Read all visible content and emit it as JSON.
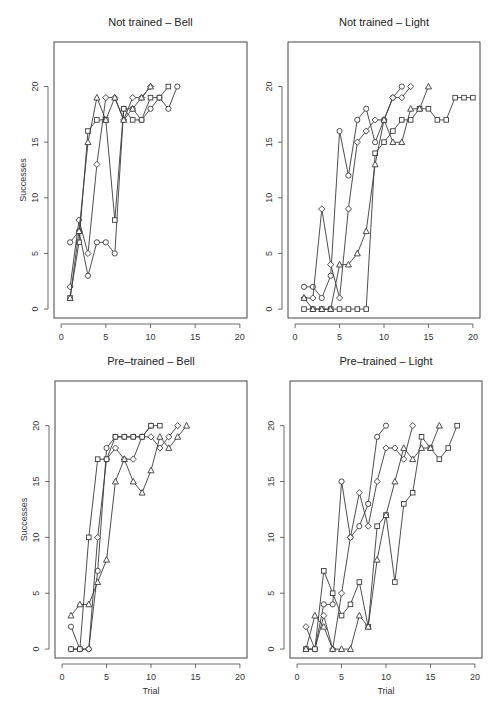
{
  "figure": {
    "ylabel": "Successes",
    "xlabel": "Trial"
  },
  "chart_data": [
    {
      "type": "line",
      "title": "Not trained – Bell",
      "xlabel": "",
      "ylabel": "Successes",
      "xlim": [
        0,
        20
      ],
      "ylim": [
        0,
        25
      ],
      "xticks": [
        0,
        5,
        10,
        15,
        20
      ],
      "yticks": [
        0,
        5,
        10,
        15,
        20
      ],
      "grid": false,
      "series": [
        {
          "name": "subject-1",
          "marker": "circle",
          "x": [
            1,
            2,
            3,
            4,
            5,
            6,
            7,
            8,
            9,
            10,
            11,
            12,
            13
          ],
          "y": [
            6,
            7,
            3,
            6,
            6,
            5,
            18,
            18,
            17,
            18,
            19,
            18,
            20
          ]
        },
        {
          "name": "subject-2",
          "marker": "diamond",
          "x": [
            1,
            2,
            3,
            4,
            5,
            6,
            7,
            8,
            9,
            10
          ],
          "y": [
            2,
            8,
            5,
            13,
            19,
            19,
            17,
            19,
            19,
            20
          ]
        },
        {
          "name": "subject-3",
          "marker": "square",
          "x": [
            1,
            2,
            3,
            4,
            5,
            6,
            7,
            8,
            9,
            10,
            11,
            12
          ],
          "y": [
            1,
            6,
            16,
            17,
            17,
            8,
            18,
            17,
            17,
            19,
            19,
            20
          ]
        },
        {
          "name": "subject-4",
          "marker": "triangle",
          "x": [
            1,
            2,
            3,
            4,
            5,
            6,
            7,
            8,
            9,
            10
          ],
          "y": [
            1,
            7,
            15,
            19,
            17,
            19,
            17,
            18,
            19,
            20
          ]
        }
      ]
    },
    {
      "type": "line",
      "title": "Not trained – Light",
      "xlabel": "",
      "ylabel": "",
      "xlim": [
        0,
        20
      ],
      "ylim": [
        0,
        25
      ],
      "xticks": [
        0,
        5,
        10,
        15,
        20
      ],
      "yticks": [
        0,
        5,
        10,
        15,
        20
      ],
      "grid": false,
      "series": [
        {
          "name": "subject-1",
          "marker": "circle",
          "x": [
            1,
            2,
            3,
            4,
            5,
            6,
            7,
            8,
            9,
            10,
            11,
            12
          ],
          "y": [
            2,
            2,
            1,
            3,
            16,
            12,
            17,
            18,
            15,
            17,
            19,
            20
          ]
        },
        {
          "name": "subject-2",
          "marker": "diamond",
          "x": [
            1,
            2,
            3,
            4,
            5,
            6,
            7,
            8,
            9,
            10,
            11,
            12,
            13
          ],
          "y": [
            1,
            1,
            9,
            4,
            1,
            9,
            15,
            16,
            17,
            17,
            19,
            19,
            20
          ]
        },
        {
          "name": "subject-3",
          "marker": "square",
          "x": [
            1,
            2,
            3,
            4,
            5,
            6,
            7,
            8,
            9,
            10,
            11,
            12,
            13,
            14,
            15,
            16,
            17,
            18,
            19,
            20
          ],
          "y": [
            0,
            0,
            0,
            0,
            0,
            0,
            0,
            0,
            14,
            15,
            16,
            17,
            17,
            18,
            18,
            17,
            17,
            19,
            19,
            19
          ]
        },
        {
          "name": "subject-4",
          "marker": "triangle",
          "x": [
            1,
            2,
            3,
            4,
            5,
            6,
            7,
            8,
            9,
            10,
            11,
            12,
            13,
            14,
            15
          ],
          "y": [
            1,
            0,
            0,
            0,
            4,
            4,
            5,
            7,
            13,
            17,
            15,
            15,
            18,
            18,
            20
          ]
        }
      ]
    },
    {
      "type": "line",
      "title": "Pre–trained – Bell",
      "xlabel": "Trial",
      "ylabel": "Successes",
      "xlim": [
        0,
        20
      ],
      "ylim": [
        0,
        25
      ],
      "xticks": [
        0,
        5,
        10,
        15,
        20
      ],
      "yticks": [
        0,
        5,
        10,
        15,
        20
      ],
      "grid": false,
      "series": [
        {
          "name": "subject-1",
          "marker": "circle",
          "x": [
            1,
            2,
            3,
            4,
            5,
            6,
            7,
            8,
            9,
            10
          ],
          "y": [
            2,
            0,
            0,
            7,
            18,
            19,
            19,
            19,
            19,
            20
          ]
        },
        {
          "name": "subject-2",
          "marker": "diamond",
          "x": [
            1,
            2,
            3,
            4,
            5,
            6,
            7,
            8,
            9,
            10,
            11,
            12,
            13
          ],
          "y": [
            0,
            0,
            0,
            10,
            17,
            18,
            17,
            17,
            19,
            19,
            18,
            19,
            20
          ]
        },
        {
          "name": "subject-3",
          "marker": "square",
          "x": [
            1,
            2,
            3,
            4,
            5,
            6,
            7,
            8,
            9,
            10,
            11
          ],
          "y": [
            0,
            0,
            10,
            17,
            17,
            19,
            19,
            19,
            19,
            20,
            20
          ]
        },
        {
          "name": "subject-4",
          "marker": "triangle",
          "x": [
            1,
            2,
            3,
            4,
            5,
            6,
            7,
            8,
            9,
            10,
            11,
            12,
            13,
            14
          ],
          "y": [
            3,
            4,
            4,
            6,
            8,
            15,
            17,
            15,
            14,
            16,
            19,
            18,
            19,
            20
          ]
        }
      ]
    },
    {
      "type": "line",
      "title": "Pre–trained – Light",
      "xlabel": "Trial",
      "ylabel": "",
      "xlim": [
        0,
        20
      ],
      "ylim": [
        0,
        25
      ],
      "xticks": [
        0,
        5,
        10,
        15,
        20
      ],
      "yticks": [
        0,
        5,
        10,
        15,
        20
      ],
      "grid": false,
      "series": [
        {
          "name": "subject-1",
          "marker": "circle",
          "x": [
            1,
            2,
            3,
            4,
            5,
            6,
            7,
            8,
            9,
            10
          ],
          "y": [
            0,
            0,
            4,
            4,
            15,
            10,
            11,
            13,
            19,
            20
          ]
        },
        {
          "name": "subject-2",
          "marker": "diamond",
          "x": [
            1,
            2,
            3,
            4,
            5,
            6,
            7,
            8,
            9,
            10,
            11,
            12,
            13
          ],
          "y": [
            2,
            0,
            3,
            0,
            5,
            10,
            14,
            11,
            15,
            18,
            18,
            17,
            20
          ]
        },
        {
          "name": "subject-3",
          "marker": "square",
          "x": [
            1,
            2,
            3,
            4,
            5,
            6,
            7,
            8,
            9,
            10,
            11,
            12,
            13,
            14,
            15,
            16,
            17,
            18
          ],
          "y": [
            0,
            0,
            7,
            5,
            3,
            4,
            6,
            2,
            11,
            12,
            6,
            13,
            14,
            19,
            18,
            17,
            18,
            20
          ]
        },
        {
          "name": "subject-4",
          "marker": "triangle",
          "x": [
            1,
            2,
            3,
            4,
            5,
            6,
            7,
            8,
            9,
            10,
            11,
            12,
            13,
            14,
            15,
            16
          ],
          "y": [
            0,
            3,
            2,
            0,
            0,
            0,
            3,
            2,
            8,
            12,
            15,
            18,
            17,
            18,
            18,
            20
          ]
        }
      ]
    }
  ],
  "colors": {
    "line": "#3a3a3a",
    "marker_fill": "#ffffff",
    "axis": "#444444",
    "text": "#222222"
  }
}
